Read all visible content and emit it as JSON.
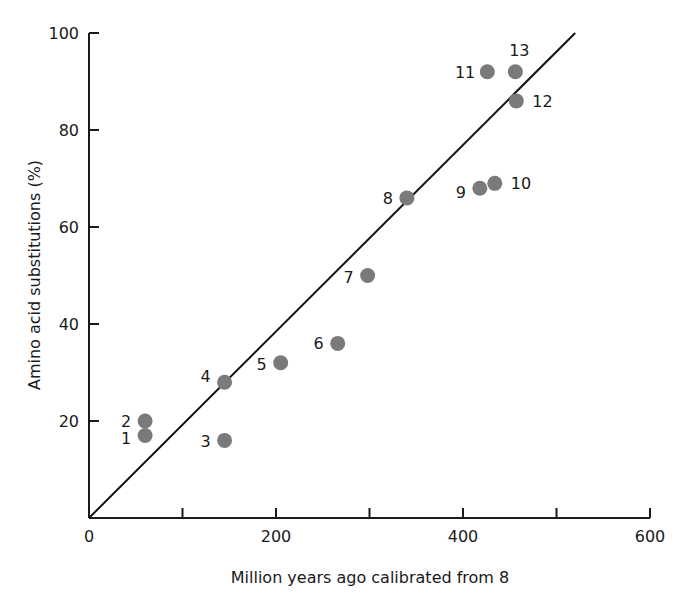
{
  "chart_data": {
    "type": "scatter",
    "title": "",
    "xlabel": "Million years ago calibrated from 8",
    "ylabel": "Amino acid substitutions (%)",
    "xlim": [
      0,
      600
    ],
    "ylim": [
      0,
      100
    ],
    "x_ticks": [
      0,
      100,
      200,
      300,
      400,
      500,
      600
    ],
    "x_tick_labels": [
      "0",
      "",
      "200",
      "",
      "400",
      "",
      "600"
    ],
    "y_ticks": [
      20,
      40,
      60,
      80,
      100
    ],
    "y_tick_labels": [
      "20",
      "40",
      "60",
      "80",
      "100"
    ],
    "grid": false,
    "legend": null,
    "marker_color": "#7a7a7a",
    "points": [
      {
        "label": "1",
        "x": 60,
        "y": 17
      },
      {
        "label": "2",
        "x": 60,
        "y": 20
      },
      {
        "label": "3",
        "x": 145,
        "y": 16
      },
      {
        "label": "4",
        "x": 145,
        "y": 28
      },
      {
        "label": "5",
        "x": 205,
        "y": 32
      },
      {
        "label": "6",
        "x": 266,
        "y": 36
      },
      {
        "label": "7",
        "x": 298,
        "y": 50
      },
      {
        "label": "8",
        "x": 340,
        "y": 66
      },
      {
        "label": "9",
        "x": 418,
        "y": 68
      },
      {
        "label": "10",
        "x": 434,
        "y": 69
      },
      {
        "label": "11",
        "x": 426,
        "y": 92
      },
      {
        "label": "12",
        "x": 457,
        "y": 86
      },
      {
        "label": "13",
        "x": 456,
        "y": 92
      }
    ],
    "fit_line": {
      "x0": 0,
      "y0": 0,
      "x1": 520,
      "y1": 100
    }
  }
}
